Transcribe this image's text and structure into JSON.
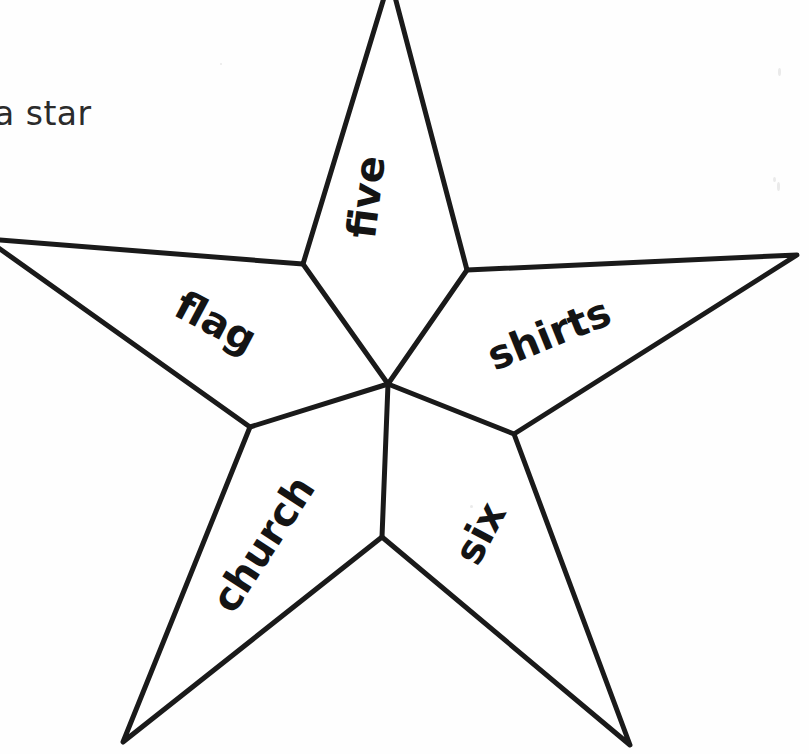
{
  "page": {
    "background_color": "#ffffff",
    "ink_color": "#1a1a1a",
    "width": 809,
    "height": 754
  },
  "instruction": {
    "text": "a star",
    "note_clipped_left": true,
    "color": "#2b2b2b"
  },
  "figure": {
    "name": "five-pointed-star",
    "shape": "star",
    "segments": [
      {
        "id": "five",
        "label": "five",
        "position": "top-point",
        "rotation_deg": -83
      },
      {
        "id": "flag",
        "label": "flag",
        "position": "upper-left-point",
        "rotation_deg": 28
      },
      {
        "id": "shirts",
        "label": "shirts",
        "position": "upper-right-point",
        "rotation_deg": -22
      },
      {
        "id": "church",
        "label": "church",
        "position": "lower-left-point",
        "rotation_deg": -57
      },
      {
        "id": "six",
        "label": "six",
        "position": "lower-right-point",
        "rotation_deg": -62
      }
    ],
    "outer_points": [
      {
        "name": "top",
        "x": 390,
        "y": -22
      },
      {
        "name": "right",
        "x": 797,
        "y": 255
      },
      {
        "name": "bottom-right",
        "x": 630,
        "y": 745
      },
      {
        "name": "bottom-left",
        "x": 123,
        "y": 742
      },
      {
        "name": "left",
        "x": -14,
        "y": 239
      }
    ],
    "inner_points": [
      {
        "name": "upper-right",
        "x": 467,
        "y": 270
      },
      {
        "name": "right",
        "x": 514,
        "y": 434
      },
      {
        "name": "bottom",
        "x": 382,
        "y": 537
      },
      {
        "name": "left",
        "x": 250,
        "y": 427
      },
      {
        "name": "upper-left",
        "x": 303,
        "y": 264
      }
    ],
    "center": {
      "x": 388,
      "y": 384
    },
    "stroke_width": 5
  }
}
